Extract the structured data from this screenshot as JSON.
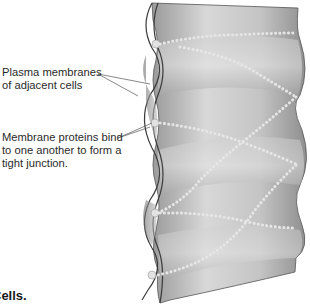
{
  "figure": {
    "labels": [
      {
        "id": "plasma-membranes",
        "lines": [
          "Plasma membranes",
          "of adjacent cells"
        ]
      },
      {
        "id": "membrane-proteins",
        "lines": [
          "Membrane proteins bind",
          "to one another to form a",
          "tight junction."
        ]
      }
    ],
    "caption": "Cells.",
    "colors": {
      "cell_surface": "#b8b8b8",
      "cell_highlight": "#e4e4e4",
      "cell_shadow": "#7a7a7a",
      "protein_beads": "#dcdcdc",
      "leader_line": "#555555",
      "text": "#2a2a2a"
    }
  }
}
